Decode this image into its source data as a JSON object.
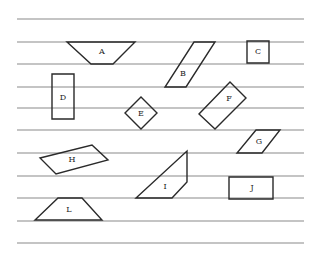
{
  "diagram": {
    "width": 318,
    "height": 254,
    "colors": {
      "background": "#ffffff",
      "ruled_line": "#8a8a8a",
      "shape_stroke": "#2a2a2a",
      "label": "#222222"
    },
    "ruled_lines": {
      "x_start": 17,
      "x_end": 304,
      "y_positions": [
        19,
        42,
        64,
        87,
        108,
        130,
        153,
        176,
        198,
        221,
        243
      ]
    },
    "shapes": [
      {
        "id": "A",
        "label": "A",
        "kind": "trapezoid-inverted",
        "points": "67,42 135,42 113,64 91,64",
        "label_pos": [
          102,
          52
        ]
      },
      {
        "id": "B",
        "label": "B",
        "kind": "parallelogram",
        "points": "194,42 215,42 186,87 165,87",
        "label_pos": [
          183,
          74
        ]
      },
      {
        "id": "C",
        "label": "C",
        "kind": "square",
        "points": "247,41 269,41 269,63 247,63",
        "label_pos": [
          258,
          52
        ]
      },
      {
        "id": "D",
        "label": "D",
        "kind": "rectangle",
        "points": "52,74 74,74 74,119 52,119",
        "label_pos": [
          63,
          98
        ]
      },
      {
        "id": "E",
        "label": "E",
        "kind": "diamond",
        "points": "141,97 157,113 141,129 125,113",
        "label_pos": [
          141,
          114
        ]
      },
      {
        "id": "F",
        "label": "F",
        "kind": "rotated-rectangle",
        "points": "230,82 246,98 215,129 199,114",
        "label_pos": [
          229,
          99
        ]
      },
      {
        "id": "G",
        "label": "G",
        "kind": "parallelogram",
        "points": "256,130 280,130 262,153 237,153",
        "label_pos": [
          259,
          142
        ]
      },
      {
        "id": "H",
        "label": "H",
        "kind": "parallelogram",
        "points": "40,158 92,145 108,160 56,174",
        "label_pos": [
          72,
          160
        ]
      },
      {
        "id": "I",
        "label": "I",
        "kind": "trapezoid",
        "points": "187,151 187,182 172,198 136,198",
        "label_pos": [
          165,
          187
        ]
      },
      {
        "id": "J",
        "label": "J",
        "kind": "rectangle",
        "points": "229,177 273,177 273,199 229,199",
        "label_pos": [
          252,
          188
        ]
      },
      {
        "id": "L",
        "label": "L",
        "kind": "trapezoid",
        "points": "58,198 82,198 102,220 35,220",
        "label_pos": [
          69,
          210
        ]
      }
    ]
  }
}
